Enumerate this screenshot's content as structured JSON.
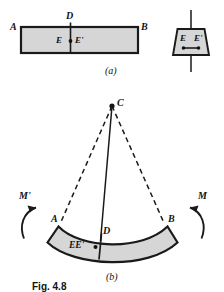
{
  "figure": {
    "number": "Fig. 4.8",
    "panels": [
      {
        "id": "a",
        "caption": "(a)",
        "description": "straight prismatic member before bending"
      },
      {
        "id": "b",
        "caption": "(b)",
        "description": "member in pure bending, curved about center of curvature C"
      }
    ],
    "colors": {
      "fill": "#d6d6d6",
      "stroke": "#1a1a1a",
      "background": "#ffffff",
      "text": "#121212"
    }
  },
  "panel_a": {
    "caption": "(a)",
    "labels": {
      "left_end": "A",
      "right_end": "B",
      "top_mid": "D",
      "point_e": "E",
      "point_e_prime": "E'"
    }
  },
  "panel_a_section": {
    "labels": {
      "point_e": "E",
      "point_e_prime": "E'"
    }
  },
  "panel_b": {
    "caption": "(b)",
    "labels": {
      "center_of_curvature": "C",
      "left_end": "A",
      "right_end": "B",
      "top_mid": "D",
      "neutral_points": "EE'",
      "moment_right": "M",
      "moment_left": "M'"
    }
  }
}
